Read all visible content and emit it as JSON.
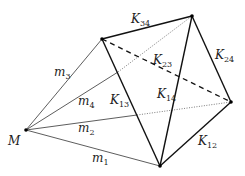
{
  "diagram": {
    "title": "",
    "nodes": [
      {
        "id": "M",
        "label": "M",
        "x": 26,
        "y": 130
      },
      {
        "id": "P1",
        "label": "",
        "x": 160,
        "y": 166
      },
      {
        "id": "P2",
        "label": "",
        "x": 231,
        "y": 102
      },
      {
        "id": "P3",
        "label": "",
        "x": 102,
        "y": 39
      },
      {
        "id": "P4",
        "label": "",
        "x": 192,
        "y": 16
      }
    ],
    "labels": {
      "M": "M",
      "m1": {
        "base": "m",
        "sub": "1"
      },
      "m2": {
        "base": "m",
        "sub": "2"
      },
      "m3": {
        "base": "m",
        "sub": "3"
      },
      "m4": {
        "base": "m",
        "sub": "4"
      },
      "K12": {
        "base": "K",
        "sub": "12"
      },
      "K13": {
        "base": "K",
        "sub": "13"
      },
      "K14": {
        "base": "K",
        "sub": "14"
      },
      "K23": {
        "base": "K",
        "sub": "23"
      },
      "K24": {
        "base": "K",
        "sub": "24"
      },
      "K34": {
        "base": "K",
        "sub": "34"
      }
    },
    "edges": [
      {
        "from": "M",
        "to": "P1",
        "label": "m1",
        "style": "thin"
      },
      {
        "from": "M",
        "to": "P2",
        "label": "m2",
        "style": "thin-dotted-behind"
      },
      {
        "from": "M",
        "to": "P3",
        "label": "m3",
        "style": "thin"
      },
      {
        "from": "M",
        "to": "P4",
        "label": "m4",
        "style": "thin-dotted-behind"
      },
      {
        "from": "P1",
        "to": "P2",
        "label": "K12",
        "style": "thick"
      },
      {
        "from": "P1",
        "to": "P3",
        "label": "K13",
        "style": "thick"
      },
      {
        "from": "P1",
        "to": "P4",
        "label": "K14",
        "style": "thick"
      },
      {
        "from": "P3",
        "to": "P2",
        "label": "K23",
        "style": "dashed"
      },
      {
        "from": "P2",
        "to": "P4",
        "label": "K24",
        "style": "thick"
      },
      {
        "from": "P3",
        "to": "P4",
        "label": "K34",
        "style": "thick"
      }
    ]
  }
}
